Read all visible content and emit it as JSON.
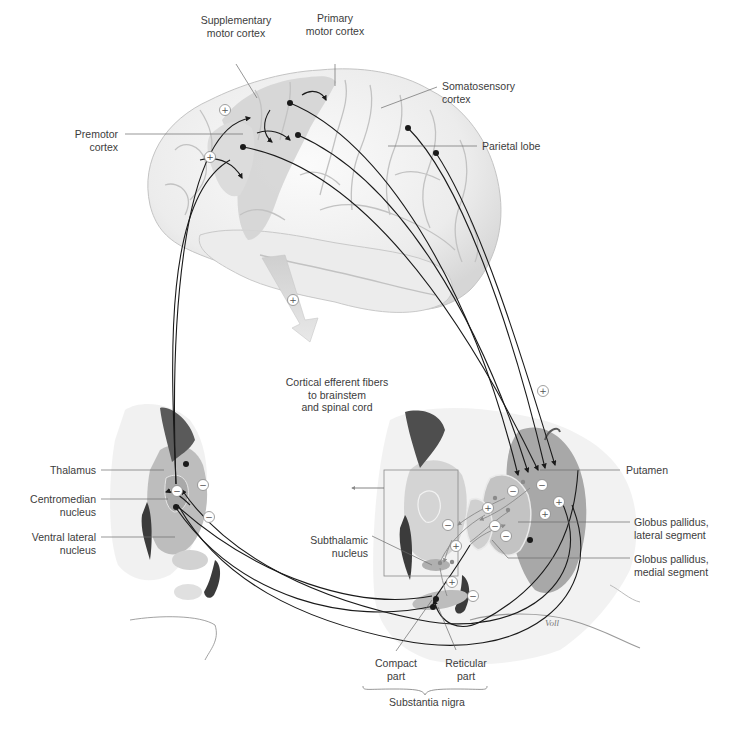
{
  "diagram": {
    "signature": "Voll",
    "signs": {
      "excitatory": "+",
      "inhibitory": "−"
    },
    "colors": {
      "line": "#1a1a1a",
      "label_leader": "#6a6a6a",
      "brain_base": "#f2f2f2",
      "brain_shade": "#d9d9d9",
      "motor_area": "#cfcfcf",
      "nucleus_gray": "#b8b8b8",
      "ventricle_dark": "#3b3b3b",
      "text": "#3c3c3c"
    },
    "labels": {
      "supplementary_motor_cortex": "Supplementary\nmotor cortex",
      "primary_motor_cortex": "Primary\nmotor cortex",
      "somatosensory_cortex": "Somatosensory\ncortex",
      "premotor_cortex": "Premotor\ncortex",
      "parietal_lobe": "Parietal lobe",
      "cortical_efferent_fibers": "Cortical efferent fibers\nto brainstem\nand spinal cord",
      "thalamus": "Thalamus",
      "centromedian_nucleus": "Centromedian\nnucleus",
      "ventral_lateral_nucleus": "Ventral lateral\nnucleus",
      "putamen": "Putamen",
      "globus_pallidus_lateral": "Globus pallidus,\nlateral segment",
      "globus_pallidus_medial": "Globus pallidus,\nmedial segment",
      "subthalamic_nucleus": "Subthalamic\nnucleus",
      "compact_part": "Compact\npart",
      "reticular_part": "Reticular\npart",
      "substantia_nigra": "Substantia nigra"
    }
  }
}
